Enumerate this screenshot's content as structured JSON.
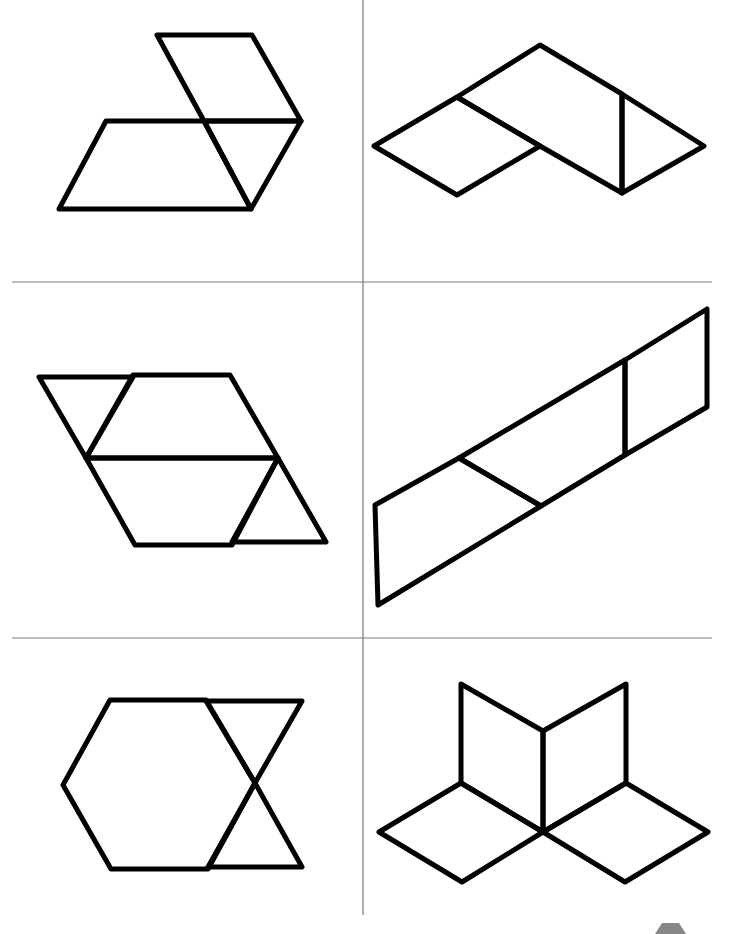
{
  "colors": {
    "stroke": "#000000",
    "grid": "#7a7a7a",
    "background": "#ffffff",
    "corner_mark": "#888888"
  },
  "grid": {
    "vertical": {
      "x": 363,
      "y1": 0,
      "y2": 915
    },
    "horizontal": [
      {
        "y": 282,
        "x1": 12,
        "x2": 712
      },
      {
        "y": 638,
        "x1": 12,
        "x2": 712
      }
    ]
  },
  "panels": [
    {
      "id": "panel-1",
      "label": "rhombus, trapezoid and triangle",
      "shapes": [
        {
          "type": "rhombus",
          "points": "157,35 252,35 301,121 204,121"
        },
        {
          "type": "trapezoid",
          "points": "106,121 204,121 251,209 59,209"
        },
        {
          "type": "triangle",
          "points": "204,121 301,121 251,209"
        }
      ]
    },
    {
      "id": "panel-2",
      "label": "rhombus, trapezoid and triangle",
      "shapes": [
        {
          "type": "rhombus",
          "points": "374,146 457,97 540,146 457,195"
        },
        {
          "type": "trapezoid",
          "points": "457,97 540,45 622,94 622,193 540,146"
        },
        {
          "type": "triangle",
          "points": "622,94 704,146 622,193"
        }
      ]
    },
    {
      "id": "panel-3",
      "label": "two trapezoids and two triangles",
      "shapes": [
        {
          "type": "triangle",
          "points": "39,377 133,377 86,458"
        },
        {
          "type": "trapezoid",
          "points": "133,375 230,375 278,458 86,458"
        },
        {
          "type": "trapezoid",
          "points": "86,458 278,458 232,545 135,545"
        },
        {
          "type": "triangle",
          "points": "278,458 326,542 232,542"
        }
      ]
    },
    {
      "id": "panel-4",
      "label": "trapezoid and rhombi strip",
      "shapes": [
        {
          "type": "trapezoid",
          "points": "375,505 459,458 541,506 378,605"
        },
        {
          "type": "rhombus",
          "points": "459,458 625,360 625,455 541,506"
        },
        {
          "type": "rhombus",
          "points": "625,360 707,309 707,407 625,455"
        }
      ]
    },
    {
      "id": "panel-5",
      "label": "hexagon and two triangles",
      "shapes": [
        {
          "type": "hexagon",
          "points": "110,700 206,700 255,783 208,869 111,869 63,785"
        },
        {
          "type": "triangle",
          "points": "206,701 302,701 255,783"
        },
        {
          "type": "triangle",
          "points": "255,783 302,867 208,867"
        }
      ]
    },
    {
      "id": "panel-6",
      "label": "four rhombi star",
      "shapes": [
        {
          "type": "rhombus",
          "points": "461,684 543,731 543,832 461,783"
        },
        {
          "type": "rhombus",
          "points": "543,731 626,684 626,783 543,832"
        },
        {
          "type": "rhombus",
          "points": "461,783 543,832 462,882 379,832"
        },
        {
          "type": "rhombus",
          "points": "626,783 708,832 625,882 543,832"
        }
      ]
    }
  ],
  "corner_mark": {
    "points": "655,934 662,923 679,923 686,934"
  }
}
